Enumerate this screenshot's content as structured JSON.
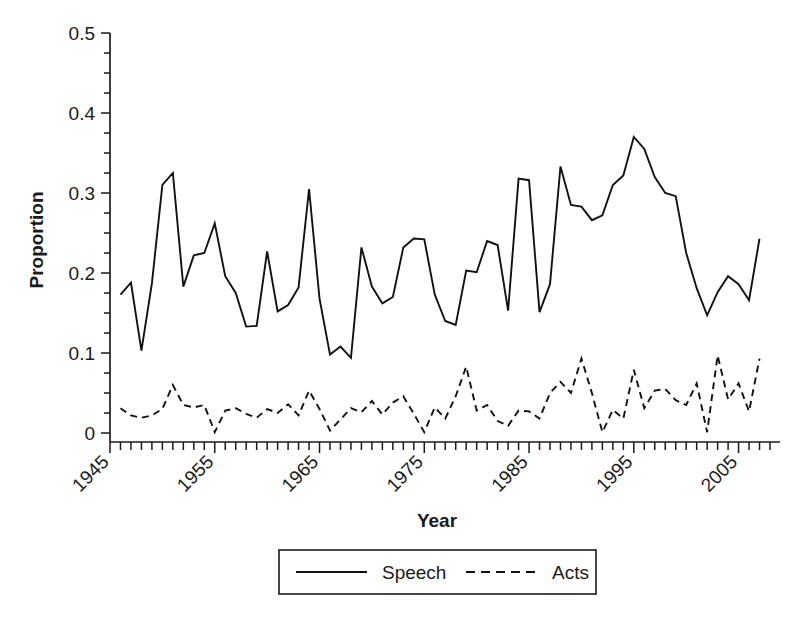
{
  "chart_data": {
    "type": "line",
    "title": "",
    "xlabel": "Year",
    "ylabel": "Proportion",
    "xlim": [
      1945,
      2008
    ],
    "ylim": [
      0,
      0.5
    ],
    "grid": false,
    "legend_position": "bottom",
    "y_ticks": [
      0,
      0.1,
      0.2,
      0.3,
      0.4,
      0.5
    ],
    "y_tick_labels": [
      "0",
      "0.1",
      "0.2",
      "0.3",
      "0.4",
      "0.5"
    ],
    "y_minor_tick_step": 0.025,
    "x_ticks": [
      1945,
      1955,
      1965,
      1975,
      1985,
      1995,
      2005
    ],
    "x_tick_labels": [
      "1945",
      "1955",
      "1965",
      "1975",
      "1985",
      "1995",
      "2005"
    ],
    "x_tick_label_rotation": -45,
    "x_minor_tick_step": 1,
    "x": [
      1946,
      1947,
      1948,
      1949,
      1950,
      1951,
      1952,
      1953,
      1954,
      1955,
      1956,
      1957,
      1958,
      1959,
      1960,
      1961,
      1962,
      1963,
      1964,
      1965,
      1966,
      1967,
      1968,
      1969,
      1970,
      1971,
      1972,
      1973,
      1974,
      1975,
      1976,
      1977,
      1978,
      1979,
      1980,
      1981,
      1982,
      1983,
      1984,
      1985,
      1986,
      1987,
      1988,
      1989,
      1990,
      1991,
      1992,
      1993,
      1994,
      1995,
      1996,
      1997,
      1998,
      1999,
      2000,
      2001,
      2002,
      2003,
      2004,
      2005,
      2006,
      2007
    ],
    "series": [
      {
        "name": "Speech",
        "style": "solid",
        "color": "#111111",
        "values": [
          0.173,
          0.188,
          0.103,
          0.187,
          0.31,
          0.325,
          0.183,
          0.222,
          0.225,
          0.262,
          0.196,
          0.175,
          0.133,
          0.134,
          0.227,
          0.152,
          0.16,
          0.182,
          0.305,
          0.168,
          0.098,
          0.108,
          0.094,
          0.232,
          0.183,
          0.162,
          0.17,
          0.232,
          0.243,
          0.242,
          0.173,
          0.14,
          0.135,
          0.203,
          0.201,
          0.24,
          0.235,
          0.153,
          0.318,
          0.316,
          0.151,
          0.186,
          0.333,
          0.285,
          0.283,
          0.266,
          0.272,
          0.31,
          0.322,
          0.37,
          0.355,
          0.32,
          0.3,
          0.296,
          0.225,
          0.181,
          0.147,
          0.176,
          0.196,
          0.186,
          0.166,
          0.243
        ]
      },
      {
        "name": "Acts",
        "style": "dashed",
        "color": "#111111",
        "values": [
          0.031,
          0.022,
          0.019,
          0.022,
          0.03,
          0.06,
          0.035,
          0.032,
          0.035,
          0.001,
          0.028,
          0.031,
          0.024,
          0.019,
          0.03,
          0.025,
          0.036,
          0.022,
          0.053,
          0.03,
          0.003,
          0.017,
          0.031,
          0.026,
          0.04,
          0.023,
          0.038,
          0.046,
          0.024,
          0.001,
          0.032,
          0.018,
          0.046,
          0.083,
          0.028,
          0.035,
          0.015,
          0.009,
          0.028,
          0.027,
          0.018,
          0.05,
          0.064,
          0.05,
          0.093,
          0.05,
          0.001,
          0.029,
          0.018,
          0.079,
          0.031,
          0.053,
          0.055,
          0.041,
          0.035,
          0.062,
          0.001,
          0.097,
          0.042,
          0.062,
          0.027,
          0.093
        ]
      }
    ],
    "legend": [
      {
        "label": "Speech",
        "style": "solid"
      },
      {
        "label": "Acts",
        "style": "dashed"
      }
    ]
  }
}
